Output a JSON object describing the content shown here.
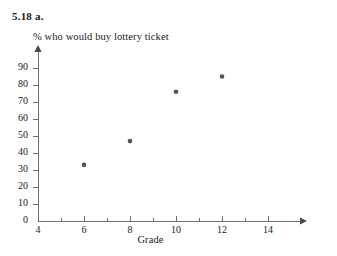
{
  "header": {
    "problem_label": "5.18  a."
  },
  "chart_data": {
    "type": "scatter",
    "title": "",
    "xlabel": "Grade",
    "ylabel": "% who would buy lottery ticket",
    "xlim": [
      4,
      15
    ],
    "ylim": [
      0,
      95
    ],
    "grid": false,
    "legend": false,
    "x_ticks": [
      4,
      6,
      8,
      10,
      12,
      14
    ],
    "x_tick_labels": [
      "4",
      "6",
      "8",
      "10",
      "12",
      "14"
    ],
    "x_minor_ticks": [
      5,
      7,
      9,
      11,
      13
    ],
    "y_ticks": [
      0,
      10,
      20,
      30,
      40,
      50,
      60,
      70,
      80,
      90
    ],
    "y_tick_labels": [
      "0",
      "10",
      "20",
      "30",
      "40",
      "50",
      "60",
      "70",
      "80",
      "90"
    ],
    "marker_color": "#555555",
    "axis_color": "#6e6e6e",
    "points": [
      {
        "x": 6,
        "y": 33
      },
      {
        "x": 8,
        "y": 47
      },
      {
        "x": 10,
        "y": 76
      },
      {
        "x": 12,
        "y": 85
      }
    ],
    "x": [
      6,
      8,
      10,
      12
    ],
    "values": [
      33,
      47,
      76,
      85
    ]
  }
}
